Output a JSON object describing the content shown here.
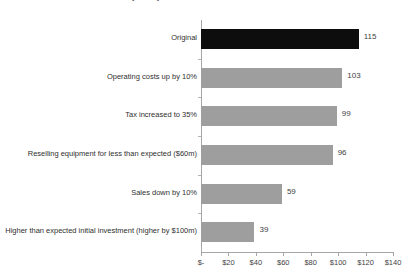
{
  "chart_data": {
    "type": "bar",
    "orientation": "horizontal",
    "title": "Sensitivity analysis",
    "xlabel": "",
    "ylabel": "",
    "xlim": [
      0,
      140
    ],
    "grid": false,
    "legend": false,
    "categories": [
      "Original",
      "Operating costs up by 10%",
      "Tax increased to 35%",
      "Reselling equipment for less than expected ($60m)",
      "Sales down by 10%",
      "Higher than expected initial investment (higher by $100m)"
    ],
    "values": [
      115,
      103,
      99,
      96,
      59,
      39
    ],
    "value_labels": [
      "115",
      "103",
      "99",
      "96",
      "59",
      "39"
    ],
    "bar_colors": [
      "#0d0d0d",
      "#9e9e9e",
      "#9e9e9e",
      "#9e9e9e",
      "#9e9e9e",
      "#9e9e9e"
    ],
    "xticks": [
      0,
      20,
      40,
      60,
      80,
      100,
      120,
      140
    ],
    "xtick_labels": [
      "$-",
      "$20",
      "$40",
      "$60",
      "$80",
      "$100",
      "$120",
      "$140"
    ],
    "colors": {
      "highlight": "#0d0d0d",
      "bar": "#9e9e9e",
      "axis": "#a6a6a6",
      "text": "#2f2f2f",
      "background": "#ffffff"
    }
  }
}
